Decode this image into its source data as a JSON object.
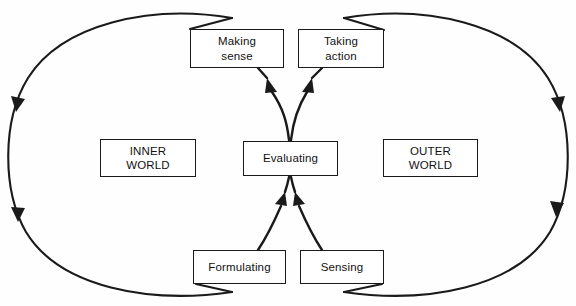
{
  "diagram": {
    "background_color": "#fefefe",
    "stroke_color": "#1a1a1a",
    "nodes": [
      {
        "id": "making-sense",
        "label": "Making\nsense"
      },
      {
        "id": "taking-action",
        "label": "Taking\naction"
      },
      {
        "id": "inner-world",
        "label": "INNER\nWORLD"
      },
      {
        "id": "evaluating",
        "label": "Evaluating"
      },
      {
        "id": "outer-world",
        "label": "OUTER\nWORLD"
      },
      {
        "id": "formulating",
        "label": "Formulating"
      },
      {
        "id": "sensing",
        "label": "Sensing"
      }
    ],
    "loops": [
      {
        "id": "left-loop",
        "side": "left",
        "direction": "clockwise-descending",
        "arrow_count": 2
      },
      {
        "id": "right-loop",
        "side": "right",
        "direction": "clockwise-descending",
        "arrow_count": 2
      }
    ],
    "connectors": [
      {
        "id": "evaluating-to-making-sense",
        "from": "evaluating",
        "to": "making-sense",
        "arrow_at": "making-sense"
      },
      {
        "id": "evaluating-to-taking-action",
        "from": "evaluating",
        "to": "taking-action",
        "arrow_at": "taking-action"
      },
      {
        "id": "formulating-to-evaluating",
        "from": "formulating",
        "to": "evaluating",
        "arrow_at": "evaluating"
      },
      {
        "id": "sensing-to-evaluating",
        "from": "sensing",
        "to": "evaluating",
        "arrow_at": "evaluating"
      }
    ]
  }
}
